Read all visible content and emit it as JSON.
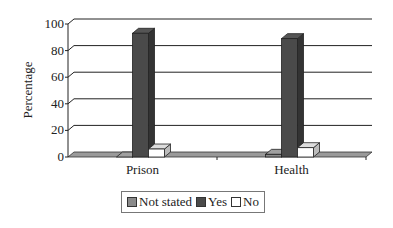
{
  "chart_data": {
    "type": "bar",
    "style": "3d-clustered-column",
    "title": "",
    "xlabel": "",
    "ylabel": "Percentage",
    "ylim": [
      0,
      100
    ],
    "yticks": [
      0,
      20,
      40,
      60,
      80,
      100
    ],
    "grid": true,
    "legend_position": "bottom",
    "categories": [
      "Prison",
      "Health"
    ],
    "series": [
      {
        "name": "Not stated",
        "color": "#8a8a8a",
        "values": [
          0,
          2
        ]
      },
      {
        "name": "Yes",
        "color": "#4a4a4a",
        "values": [
          93,
          89
        ]
      },
      {
        "name": "No",
        "color": "#ffffff",
        "values": [
          6,
          7
        ]
      }
    ]
  },
  "legend": {
    "items": [
      {
        "label": "Not stated",
        "color": "#8a8a8a"
      },
      {
        "label": "Yes",
        "color": "#4a4a4a"
      },
      {
        "label": "No",
        "color": "#ffffff"
      }
    ]
  }
}
